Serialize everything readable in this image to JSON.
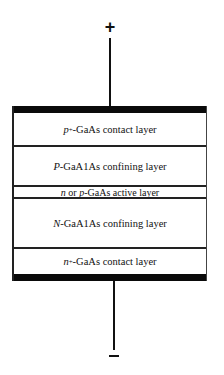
{
  "diagram": {
    "terminals": {
      "top": {
        "symbol": "+",
        "name": "positive-terminal"
      },
      "bottom": {
        "symbol": "−",
        "name": "negative-terminal"
      }
    },
    "layers": [
      {
        "prefix": "p",
        "sup": "+",
        "rest": "-GaAs contact layer",
        "role": "p-contact"
      },
      {
        "prefix": "P",
        "sup": "",
        "rest": "-GaA1As confining layer",
        "role": "p-cladding"
      },
      {
        "prefix": "n",
        "mid": " or ",
        "prefix2": "p",
        "rest": "-GaAs active layer",
        "role": "active"
      },
      {
        "prefix": "N",
        "sup": "",
        "rest": "-GaA1As confining layer",
        "role": "n-cladding"
      },
      {
        "prefix": "n",
        "sup": "+",
        "rest": "-GaAs contact layer",
        "role": "n-contact"
      }
    ],
    "colors": {
      "line": "#111111",
      "contact_bar": "#0a0a0a",
      "background": "#ffffff"
    }
  }
}
